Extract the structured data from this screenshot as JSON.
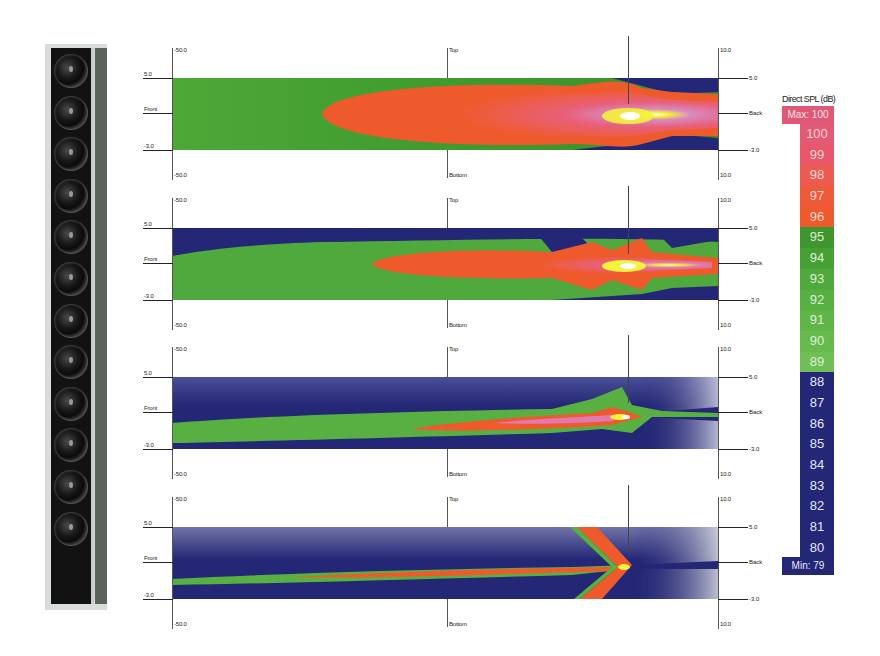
{
  "chart_data": [
    {
      "type": "heatmap",
      "title": "Direct SPL (dB) - side view, panel 1",
      "xlabel": "",
      "ylabel": "",
      "x_ticks": {
        "left": "-50.0",
        "right": "10.0"
      },
      "y_ticks": {
        "top": "5.0",
        "middle": "Front",
        "bottom": "-3.0"
      },
      "right_labels": {
        "top": "5.0",
        "middle": "Back",
        "bottom": "-3.0"
      },
      "vertical_labels": {
        "top": "Top",
        "bottom": "Bottom"
      },
      "description": "Broad lobe: green 89-95 dB far field, red/pink 96-100 dB main lobe, yellow/white peak near source; blue 80-88 dB corners near source",
      "colorscale_min": 79,
      "colorscale_max": 100
    },
    {
      "type": "heatmap",
      "title": "Direct SPL (dB) - side view, panel 2",
      "x_ticks": {
        "left": "-50.0",
        "right": "10.0"
      },
      "y_ticks": {
        "top": "5.0",
        "middle": "Front",
        "bottom": "-3.0"
      },
      "right_labels": {
        "top": "5.0",
        "middle": "Back",
        "bottom": "-3.0"
      },
      "vertical_labels": {
        "top": "Top",
        "bottom": "Bottom"
      },
      "description": "Narrower lobe: blue band along top, green body, red lobe from mid-plot to source, yellow peak at source",
      "colorscale_min": 79,
      "colorscale_max": 100
    },
    {
      "type": "heatmap",
      "title": "Direct SPL (dB) - side view, panel 3",
      "x_ticks": {
        "left": "-50.0",
        "right": "10.0"
      },
      "y_ticks": {
        "top": "5.0",
        "middle": "Front",
        "bottom": "-3.0"
      },
      "right_labels": {
        "top": "5.0",
        "middle": "Back",
        "bottom": "-3.0"
      },
      "vertical_labels": {
        "top": "Top",
        "bottom": "Bottom"
      },
      "description": "Mostly blue field, narrow green beam, thin red/pink lobe ending at source, light rays behind source",
      "colorscale_min": 79,
      "colorscale_max": 100
    },
    {
      "type": "heatmap",
      "title": "Direct SPL (dB) - side view, panel 4",
      "x_ticks": {
        "left": "-50.0",
        "right": "10.0"
      },
      "y_ticks": {
        "top": "5.0",
        "middle": "Front",
        "bottom": "-3.0"
      },
      "right_labels": {
        "top": "5.0",
        "middle": "Back",
        "bottom": "-3.0"
      },
      "vertical_labels": {
        "top": "Top",
        "bottom": "Bottom"
      },
      "description": "Blue/grey field, thin green and red beam, diagonal red lobe crossing source, grey rays behind",
      "colorscale_min": 79,
      "colorscale_max": 100
    }
  ],
  "legend": {
    "title": "Direct SPL (dB)",
    "max_label": "Max: 100",
    "min_label": "Min: 79",
    "entries": [
      {
        "value": "100",
        "color": "#e35a78"
      },
      {
        "value": "99",
        "color": "#e8566a"
      },
      {
        "value": "98",
        "color": "#ec5a52"
      },
      {
        "value": "97",
        "color": "#ee5a3a"
      },
      {
        "value": "96",
        "color": "#ef5a2c"
      },
      {
        "value": "95",
        "color": "#3f9530"
      },
      {
        "value": "94",
        "color": "#46a036"
      },
      {
        "value": "93",
        "color": "#4fa93c"
      },
      {
        "value": "92",
        "color": "#58b043"
      },
      {
        "value": "91",
        "color": "#60b548"
      },
      {
        "value": "90",
        "color": "#67ba4e"
      },
      {
        "value": "89",
        "color": "#70bf56"
      },
      {
        "value": "88",
        "color": "#242775"
      },
      {
        "value": "87",
        "color": "#242775"
      },
      {
        "value": "86",
        "color": "#242775"
      },
      {
        "value": "85",
        "color": "#242775"
      },
      {
        "value": "84",
        "color": "#242775"
      },
      {
        "value": "83",
        "color": "#242775"
      },
      {
        "value": "82",
        "color": "#242775"
      },
      {
        "value": "81",
        "color": "#242775"
      },
      {
        "value": "80",
        "color": "#242775"
      }
    ]
  },
  "axes": {
    "x_left": "-50.0",
    "x_right": "10.0",
    "top": "Top",
    "bottom": "Bottom",
    "y_top": "5.0",
    "y_mid_left": "Front",
    "y_mid_right": "Back",
    "y_bottom": "-3.0"
  },
  "speaker": {
    "driver_count": 12
  }
}
